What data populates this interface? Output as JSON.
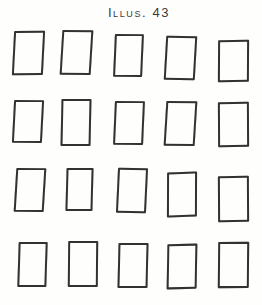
{
  "figure": {
    "caption": "Illus. 43",
    "line_color": "#333231",
    "page_background": "#fefefd",
    "rows": 4,
    "cols": 5,
    "card_count": 20,
    "cards": [
      {
        "x": 13,
        "y": 31,
        "w": 31,
        "h": 44,
        "rot": -0.5,
        "skew": -3.5
      },
      {
        "x": 61,
        "y": 30,
        "w": 31,
        "h": 45,
        "rot": 0.5,
        "skew": -3
      },
      {
        "x": 114,
        "y": 34,
        "w": 29,
        "h": 43,
        "rot": 0.5,
        "skew": -2
      },
      {
        "x": 165,
        "y": 36,
        "w": 31,
        "h": 44,
        "rot": 0.8,
        "skew": -2.5
      },
      {
        "x": 218,
        "y": 40,
        "w": 31,
        "h": 42,
        "rot": -1.2,
        "skew": -1.5
      },
      {
        "x": 13,
        "y": 100,
        "w": 30,
        "h": 43,
        "rot": 0.5,
        "skew": -2.5
      },
      {
        "x": 61,
        "y": 99,
        "w": 30,
        "h": 47,
        "rot": -0.3,
        "skew": -1.5
      },
      {
        "x": 114,
        "y": 101,
        "w": 30,
        "h": 44,
        "rot": 0.5,
        "skew": -2
      },
      {
        "x": 165,
        "y": 101,
        "w": 31,
        "h": 45,
        "rot": 0.5,
        "skew": -3
      },
      {
        "x": 218,
        "y": 102,
        "w": 31,
        "h": 45,
        "rot": -1.3,
        "skew": -1
      },
      {
        "x": 15,
        "y": 168,
        "w": 30,
        "h": 44,
        "rot": 0.5,
        "skew": -3
      },
      {
        "x": 66,
        "y": 168,
        "w": 27,
        "h": 43,
        "rot": 0,
        "skew": -1.5
      },
      {
        "x": 117,
        "y": 168,
        "w": 30,
        "h": 45,
        "rot": 1.2,
        "skew": -1.5
      },
      {
        "x": 167,
        "y": 172,
        "w": 30,
        "h": 45,
        "rot": -1.8,
        "skew": -2
      },
      {
        "x": 218,
        "y": 176,
        "w": 31,
        "h": 46,
        "rot": -0.8,
        "skew": -0.5
      },
      {
        "x": 18,
        "y": 242,
        "w": 29,
        "h": 45,
        "rot": 0.3,
        "skew": -1.5
      },
      {
        "x": 68,
        "y": 241,
        "w": 30,
        "h": 46,
        "rot": 0,
        "skew": -0.5
      },
      {
        "x": 118,
        "y": 243,
        "w": 30,
        "h": 45,
        "rot": 0.3,
        "skew": -1
      },
      {
        "x": 167,
        "y": 244,
        "w": 30,
        "h": 45,
        "rot": -1.5,
        "skew": -2.5
      },
      {
        "x": 218,
        "y": 242,
        "w": 31,
        "h": 46,
        "rot": -0.5,
        "skew": -1
      }
    ]
  }
}
